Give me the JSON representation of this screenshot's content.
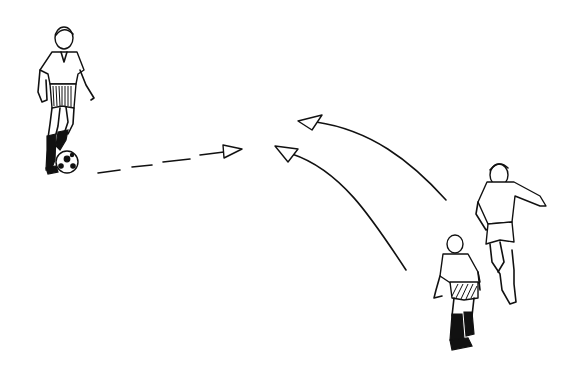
{
  "figure": {
    "title": "Soccer passing drill illustration",
    "background": "#ffffff",
    "ink_color": "#111111",
    "elements": [
      {
        "id": "player-1",
        "description": "Player dribbling ball, left side",
        "position": [
          60,
          100
        ]
      },
      {
        "id": "ball",
        "description": "Soccer ball at feet of player 1",
        "position": [
          66,
          162
        ]
      },
      {
        "id": "pass-arrow",
        "description": "Dashed arrow (pass) pointing right",
        "from": [
          98,
          172
        ],
        "to": [
          242,
          150
        ],
        "style": "dashed"
      },
      {
        "id": "run-arrow-1",
        "description": "Curved solid arrow (run) from right player to upper center",
        "from": [
          445,
          200
        ],
        "to": [
          298,
          122
        ],
        "style": "solid-curve"
      },
      {
        "id": "run-arrow-2",
        "description": "Curved solid arrow (run) from lower right player to center",
        "from": [
          405,
          270
        ],
        "to": [
          275,
          148
        ],
        "style": "solid-curve"
      },
      {
        "id": "player-2",
        "description": "Player running, right side, arm extended",
        "position": [
          500,
          230
        ]
      },
      {
        "id": "player-3",
        "description": "Player viewed from behind, lower right",
        "position": [
          458,
          290
        ]
      }
    ]
  }
}
